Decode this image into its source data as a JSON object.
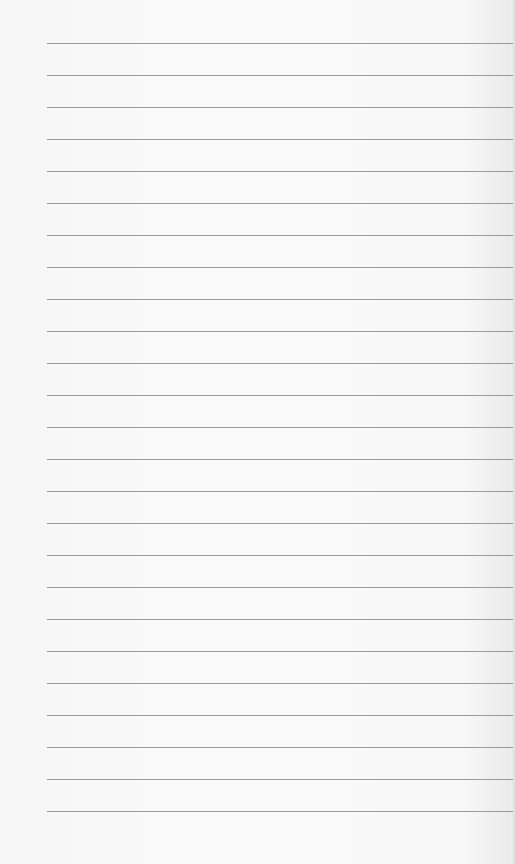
{
  "paper": {
    "type": "lined-paper",
    "line_count": 25,
    "first_line_y": 43,
    "line_spacing": 32,
    "line_color": "#9a9a9a",
    "background_color": "#f7f7f7"
  }
}
